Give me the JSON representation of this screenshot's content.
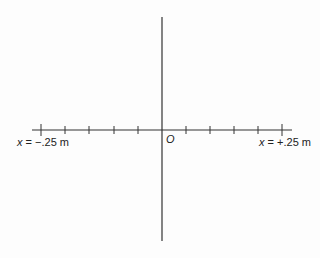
{
  "diagram": {
    "type": "coordinate-axes",
    "origin_label": "O",
    "left_label": {
      "var": "x",
      "eq": " = −.25 m"
    },
    "right_label": {
      "var": "x",
      "eq": " = +.25 m"
    },
    "horizontal_axis": {
      "x_start": 32,
      "x_end": 292,
      "y": 130
    },
    "vertical_axis": {
      "x": 162,
      "y_start": 17,
      "y_end": 241
    },
    "ticks_x": [
      41,
      65,
      89,
      114,
      138,
      186,
      210,
      234,
      258,
      282
    ],
    "tick_range": [
      "-.25 m",
      "+.25 m"
    ],
    "line_color": "#333333"
  }
}
